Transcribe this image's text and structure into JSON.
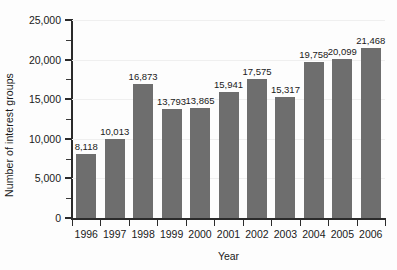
{
  "chart_data": {
    "type": "bar",
    "title": "",
    "subtitle": "",
    "xlabel": "Year",
    "ylabel": "Number of interest groups",
    "categories": [
      "1996",
      "1997",
      "1998",
      "1999",
      "2000",
      "2001",
      "2002",
      "2003",
      "2004",
      "2005",
      "2006"
    ],
    "values": [
      8118,
      10013,
      16873,
      13793,
      13865,
      15941,
      17575,
      15317,
      19758,
      20099,
      21468
    ],
    "value_labels": [
      "8,118",
      "10,013",
      "16,873",
      "13,793",
      "13,865",
      "15,941",
      "17,575",
      "15,317",
      "19,758",
      "20,099",
      "21,468"
    ],
    "ylim": [
      0,
      25000
    ],
    "y_major_ticks": [
      0,
      5000,
      10000,
      15000,
      20000,
      25000
    ],
    "y_major_tick_labels": [
      "0",
      "5,000",
      "10,000",
      "15,000",
      "20,000",
      "25,000"
    ],
    "y_minor_ticks": [
      2500,
      7500,
      12500,
      17500,
      22500
    ],
    "grid": true,
    "grid_axis": "y",
    "legend": false,
    "legend_position": "none",
    "bar_color": "#6e6e6e",
    "axis_color": "#2b2b2b",
    "grid_color": "#efefef",
    "background_color": "#fdfdfd",
    "text_color": "#1a1a1a"
  }
}
